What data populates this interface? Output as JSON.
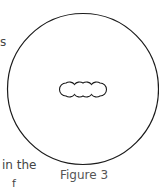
{
  "figure": {
    "caption": "Figure 3",
    "outer_circle": {
      "cx": 83,
      "cy": 89,
      "r": 76,
      "stroke": "#1a1a1a"
    },
    "bead_chain": {
      "count": 4,
      "cx_start": 66,
      "spacing": 9,
      "cy": 89,
      "r": 6.5,
      "stroke": "#1a1a1a"
    }
  },
  "text_fragments": {
    "left_top": "s",
    "left_bottom": "in the",
    "left_bottom_cut": "f"
  }
}
